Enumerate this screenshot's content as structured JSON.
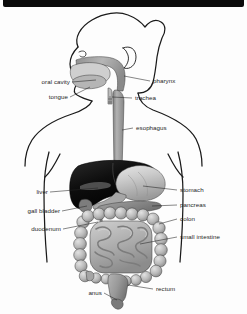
{
  "figure": {
    "view": "anterior schematic of head, neck and abdomen",
    "background_color": "#fdfdfd",
    "top_bar_color": "#0b0b0b",
    "label_color": "#1d1d1d",
    "leader_line_color": "#222222",
    "outline_color": "#1a1a1a"
  },
  "labels": {
    "oral_cavity": "oral cavity",
    "tongue": "tongue",
    "pharynx": "pharynx",
    "trachea": "trachea",
    "esophagus": "esophagus",
    "liver": "liver",
    "gall_bladder": "gall bladder",
    "duodenum": "duodenum",
    "stomach": "stomach",
    "pancreas": "pancreas",
    "colon": "colon",
    "small_intestine": "small intestine",
    "anus": "anus",
    "rectum": "rectum"
  },
  "organ_colors": {
    "liver": "#111111",
    "stomach": "#c9c9c9",
    "esophagus": "#9a9a9a",
    "pharynx": "#a8a8a8",
    "tongue": "#b5b5b5",
    "colon": "#bdbdbd",
    "small_intestine": "#b0b0b0",
    "pancreas": "#8d8d8d",
    "gall_bladder": "#7d7d7d",
    "rectum": "#9c9c9c",
    "trachea": "#bcbcbc"
  }
}
